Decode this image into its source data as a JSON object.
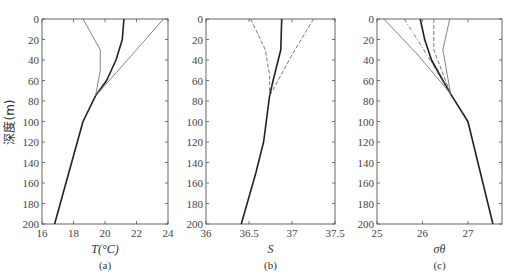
{
  "figure": {
    "ylabel": "深度(m)",
    "panels": [
      {
        "id": "a",
        "label": "(a)",
        "xlabel": "T(°C)"
      },
      {
        "id": "b",
        "label": "(b)",
        "xlabel": "S"
      },
      {
        "id": "c",
        "label": "(c)",
        "xlabel": "σθ"
      }
    ]
  },
  "chart_data": [
    {
      "type": "line",
      "title": "(a)",
      "xlabel": "T(°C)",
      "ylabel": "深度(m)",
      "xlim": [
        16,
        24
      ],
      "ylim": [
        200,
        0
      ],
      "xticks": [
        16,
        18,
        20,
        22,
        24
      ],
      "yticks": [
        0,
        20,
        40,
        60,
        80,
        100,
        120,
        140,
        160,
        180,
        200
      ],
      "series": [
        {
          "name": "thick",
          "style": "solid-thick",
          "points": [
            [
              21.2,
              0
            ],
            [
              21.1,
              20
            ],
            [
              20.7,
              40
            ],
            [
              20.1,
              60
            ],
            [
              19.4,
              75
            ],
            [
              18.6,
              100
            ],
            [
              16.8,
              200
            ]
          ]
        },
        {
          "name": "thin-left",
          "style": "solid-thin",
          "points": [
            [
              18.6,
              0
            ],
            [
              19.7,
              30
            ],
            [
              19.7,
              50
            ],
            [
              19.4,
              75
            ]
          ]
        },
        {
          "name": "thin-right",
          "style": "solid-thin",
          "points": [
            [
              23.7,
              0
            ],
            [
              22.0,
              30
            ],
            [
              19.4,
              75
            ]
          ]
        }
      ]
    },
    {
      "type": "line",
      "title": "(b)",
      "xlabel": "S",
      "ylabel": "深度(m)",
      "xlim": [
        36,
        37.5
      ],
      "ylim": [
        200,
        0
      ],
      "xticks": [
        36,
        36.5,
        37,
        37.5
      ],
      "yticks": [
        0,
        20,
        40,
        60,
        80,
        100,
        120,
        140,
        160,
        180,
        200
      ],
      "series": [
        {
          "name": "thick",
          "style": "solid-thick",
          "points": [
            [
              36.88,
              0
            ],
            [
              36.87,
              30
            ],
            [
              36.78,
              60
            ],
            [
              36.74,
              75
            ],
            [
              36.67,
              120
            ],
            [
              36.58,
              150
            ],
            [
              36.41,
              200
            ]
          ]
        },
        {
          "name": "dashed-left",
          "style": "dashed",
          "points": [
            [
              36.52,
              0
            ],
            [
              36.69,
              30
            ],
            [
              36.74,
              55
            ],
            [
              36.74,
              75
            ]
          ]
        },
        {
          "name": "dashed-right",
          "style": "dashed",
          "points": [
            [
              37.25,
              0
            ],
            [
              37.0,
              35
            ],
            [
              36.74,
              75
            ]
          ]
        }
      ]
    },
    {
      "type": "line",
      "title": "(c)",
      "xlabel": "σθ",
      "ylabel": "深度(m)",
      "xlim": [
        25,
        27.75
      ],
      "ylim": [
        200,
        0
      ],
      "xticks": [
        25,
        26,
        27
      ],
      "yticks": [
        0,
        20,
        40,
        60,
        80,
        100,
        120,
        140,
        160,
        180,
        200
      ],
      "series": [
        {
          "name": "thick",
          "style": "solid-thick",
          "points": [
            [
              25.95,
              0
            ],
            [
              26.05,
              20
            ],
            [
              26.2,
              40
            ],
            [
              26.45,
              60
            ],
            [
              26.62,
              73
            ],
            [
              27.0,
              100
            ],
            [
              27.55,
              200
            ]
          ]
        },
        {
          "name": "thin-far-left",
          "style": "solid-thin",
          "points": [
            [
              25.15,
              0
            ],
            [
              25.9,
              35
            ],
            [
              26.62,
              73
            ]
          ]
        },
        {
          "name": "dash-dot-left",
          "style": "dashdot",
          "points": [
            [
              25.6,
              0
            ],
            [
              26.1,
              35
            ],
            [
              26.62,
              73
            ]
          ]
        },
        {
          "name": "long-dash",
          "style": "dashed",
          "points": [
            [
              26.25,
              0
            ],
            [
              26.25,
              30
            ],
            [
              26.62,
              73
            ]
          ]
        },
        {
          "name": "thin-right",
          "style": "solid-thin",
          "points": [
            [
              26.6,
              0
            ],
            [
              26.45,
              30
            ],
            [
              26.62,
              73
            ]
          ]
        }
      ]
    }
  ]
}
